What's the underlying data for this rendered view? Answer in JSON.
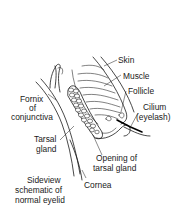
{
  "diagram": {
    "title_lines": [
      "Sideview",
      "schematic of",
      "normal eyelid"
    ],
    "labels": {
      "skin": "Skin",
      "muscle": "Muscle",
      "follicle": "Follicle",
      "cilium_line1": "Cilium",
      "cilium_line2": "(eyelash)",
      "fornix_line1": "Fornix",
      "fornix_line2": "of",
      "fornix_line3": "conjunctiva",
      "tarsal_line1": "Tarsal",
      "tarsal_line2": "gland",
      "opening_line1": "Opening of",
      "opening_line2": "tarsal gland",
      "cornea": "Cornea"
    },
    "colors": {
      "line": "#1a1a1a",
      "background": "#ffffff"
    }
  }
}
